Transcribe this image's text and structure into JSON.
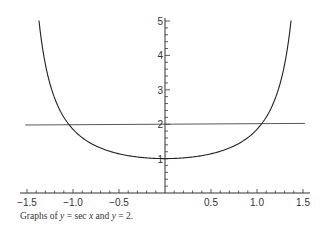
{
  "chart_data": {
    "type": "line",
    "title": "",
    "caption": {
      "prefix": "Graphs of ",
      "eq1_var": "y",
      "eq1_rest": " = sec ",
      "eq1_x": "x",
      "mid": " and ",
      "eq2_var": "y",
      "eq2_rest": " = 2."
    },
    "xlabel": "",
    "ylabel": "",
    "xlim": [
      -1.6,
      1.6
    ],
    "ylim": [
      0,
      5
    ],
    "x_ticks": [
      -1.5,
      -1.0,
      -0.5,
      0.5,
      1.0,
      1.5
    ],
    "x_tick_labels": [
      "−1.5",
      "−1.0",
      "−0.5",
      "0.5",
      "1.0",
      "1.5"
    ],
    "y_ticks": [
      1,
      2,
      3,
      4,
      5
    ],
    "y_tick_labels": [
      "1",
      "2",
      "3",
      "4",
      "5"
    ],
    "grid": false,
    "series": [
      {
        "name": "y = sec x",
        "function": "sec(x)",
        "x_range": [
          -1.37,
          1.37
        ],
        "color": "#222222"
      },
      {
        "name": "y = 2",
        "function": "2",
        "x_range": [
          -1.52,
          1.52
        ],
        "color": "#333333"
      }
    ],
    "intersections": [
      [
        -1.047,
        2
      ],
      [
        1.047,
        2
      ]
    ]
  },
  "layout": {
    "origin_px": [
      165,
      193
    ],
    "x_scale": 92,
    "y_scale": 34.4
  }
}
